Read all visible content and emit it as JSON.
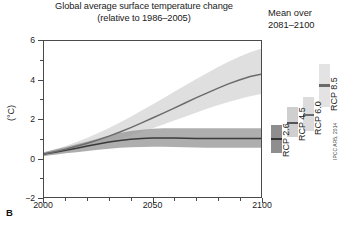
{
  "figure": {
    "panel_label": "B",
    "title_line1": "Global average surface temperature change",
    "title_line2": "(relative to 1986–2005)",
    "right_panel_line1": "Mean over",
    "right_panel_line2": "2081–2100",
    "credit": "IPCC AR5, 2014"
  },
  "chart_data": {
    "type": "line",
    "title": "Global average surface temperature change (relative to 1986–2005)",
    "xlabel": "",
    "ylabel": "(°C)",
    "xlim": [
      2000,
      2100
    ],
    "ylim": [
      -2,
      6
    ],
    "grid": false,
    "legend_position": "right-bars",
    "yticks": [
      6,
      4,
      2,
      0,
      -2
    ],
    "ytick_labels": [
      "6",
      "4",
      "2",
      "0",
      "−2"
    ],
    "yminor_step": 1,
    "xticks": [
      2000,
      2050,
      2100
    ],
    "xtick_labels": [
      "2000",
      "2050",
      "2100"
    ],
    "xminor_step": 10,
    "x": [
      2000,
      2005,
      2010,
      2015,
      2020,
      2025,
      2030,
      2035,
      2040,
      2045,
      2050,
      2055,
      2060,
      2065,
      2070,
      2075,
      2080,
      2085,
      2090,
      2095,
      2100
    ],
    "series": [
      {
        "name": "RCP 2.6",
        "color": "#3a3a3a",
        "band_color": "#9a9a9a",
        "values": [
          0.2,
          0.3,
          0.4,
          0.5,
          0.62,
          0.72,
          0.82,
          0.9,
          0.96,
          1.0,
          1.02,
          1.03,
          1.02,
          1.01,
          1.0,
          1.0,
          1.0,
          1.0,
          1.0,
          1.0,
          1.0
        ],
        "band_low": [
          0.1,
          0.17,
          0.24,
          0.3,
          0.36,
          0.42,
          0.48,
          0.52,
          0.55,
          0.57,
          0.58,
          0.58,
          0.57,
          0.55,
          0.54,
          0.53,
          0.52,
          0.52,
          0.52,
          0.52,
          0.52
        ],
        "band_high": [
          0.3,
          0.44,
          0.57,
          0.7,
          0.85,
          1.0,
          1.15,
          1.28,
          1.38,
          1.45,
          1.5,
          1.52,
          1.53,
          1.53,
          1.53,
          1.53,
          1.53,
          1.53,
          1.53,
          1.53,
          1.53
        ]
      },
      {
        "name": "RCP 8.5",
        "color": "#6b6b6b",
        "band_color": "#d2d2d2",
        "values": [
          0.2,
          0.32,
          0.45,
          0.6,
          0.76,
          0.93,
          1.12,
          1.33,
          1.56,
          1.8,
          2.05,
          2.3,
          2.56,
          2.82,
          3.08,
          3.33,
          3.57,
          3.8,
          4.0,
          4.18,
          4.3
        ],
        "band_low": [
          0.1,
          0.2,
          0.3,
          0.42,
          0.55,
          0.68,
          0.83,
          0.99,
          1.16,
          1.34,
          1.53,
          1.72,
          1.92,
          2.12,
          2.32,
          2.52,
          2.7,
          2.87,
          3.03,
          3.17,
          3.28
        ],
        "band_high": [
          0.3,
          0.45,
          0.62,
          0.82,
          1.04,
          1.28,
          1.54,
          1.82,
          2.12,
          2.43,
          2.75,
          3.07,
          3.4,
          3.72,
          4.04,
          4.35,
          4.65,
          4.93,
          5.19,
          5.42,
          5.6
        ]
      }
    ],
    "mean_bars": {
      "period": "2081–2100",
      "bars": [
        {
          "label": "RCP 2.6",
          "mean": 1.0,
          "low": 0.3,
          "high": 1.7,
          "color": "#8e8e8e",
          "mean_color": "#333333"
        },
        {
          "label": "RCP 4.5",
          "mean": 1.8,
          "low": 1.1,
          "high": 2.6,
          "color": "#cfcfcf",
          "mean_color": "#555555"
        },
        {
          "label": "RCP 6.0",
          "mean": 2.2,
          "low": 1.4,
          "high": 3.1,
          "color": "#dcdcdc",
          "mean_color": "#6a6a6a"
        },
        {
          "label": "RCP 8.5",
          "mean": 3.7,
          "low": 2.6,
          "high": 4.8,
          "color": "#e3e3e3",
          "mean_color": "#6a6a6a"
        }
      ]
    }
  }
}
